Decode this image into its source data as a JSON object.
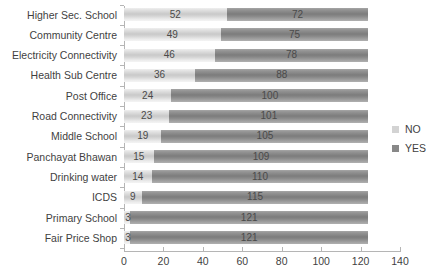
{
  "chart_data": {
    "type": "bar",
    "subtype": "stacked-horizontal-bar",
    "title": "",
    "xlabel": "",
    "ylabel": "",
    "xlim": [
      0,
      140
    ],
    "xticks": [
      0,
      20,
      40,
      60,
      80,
      100,
      120,
      140
    ],
    "xtick_labels": [
      "0",
      "20",
      "40",
      "60",
      "80",
      "100",
      "120",
      "140"
    ],
    "grid": false,
    "legend_position": "right",
    "categories": [
      "Higher Sec. School",
      "Community Centre",
      "Electricity Connectivity",
      "Health Sub Centre",
      "Post Office",
      "Road Connectivity",
      "Middle School",
      "Panchayat Bhawan",
      "Drinking water",
      "ICDS",
      "Primary School",
      "Fair Price Shop"
    ],
    "series": [
      {
        "name": "NO",
        "color": "#d3d3d3",
        "values": [
          52,
          49,
          46,
          36,
          24,
          23,
          19,
          15,
          14,
          9,
          3,
          3
        ]
      },
      {
        "name": "YES",
        "color": "#888888",
        "values": [
          72,
          75,
          78,
          88,
          100,
          101,
          105,
          109,
          110,
          115,
          121,
          121
        ]
      }
    ]
  },
  "legend": {
    "items": [
      {
        "label": "NO",
        "color": "#d3d3d3"
      },
      {
        "label": "YES",
        "color": "#888888"
      }
    ]
  }
}
